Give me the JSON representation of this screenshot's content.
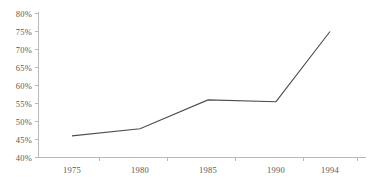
{
  "chart_data": {
    "type": "line",
    "title": "",
    "subtitle": "",
    "xlabel": "",
    "ylabel": "",
    "categories": [
      "1975",
      "1980",
      "1985",
      "1990",
      "1994"
    ],
    "x": [
      1975,
      1980,
      1985,
      1990,
      1994
    ],
    "values": [
      46,
      48,
      56,
      55.5,
      75
    ],
    "series": [
      {
        "name": "",
        "values": [
          46,
          48,
          56,
          55.5,
          75
        ]
      }
    ],
    "ylim": [
      40,
      80
    ],
    "ytick_step": 5,
    "ytick_labels": [
      "80%",
      "75%",
      "70%",
      "65%",
      "60%",
      "55%",
      "50%",
      "45%",
      "40%"
    ],
    "ytick_values": [
      80,
      75,
      70,
      65,
      60,
      55,
      50,
      45,
      40
    ],
    "xtick_labels": [
      "1975",
      "1980",
      "1985",
      "1990",
      "1994"
    ],
    "grid": false,
    "legend": "none",
    "line_color": "#4d4d4d",
    "axis_color": "#b8b8b8",
    "text_color": "#595959",
    "background_color": "#ffffff"
  },
  "axes": {
    "y_axis_name": "percent-axis",
    "x_axis_name": "year-axis"
  }
}
